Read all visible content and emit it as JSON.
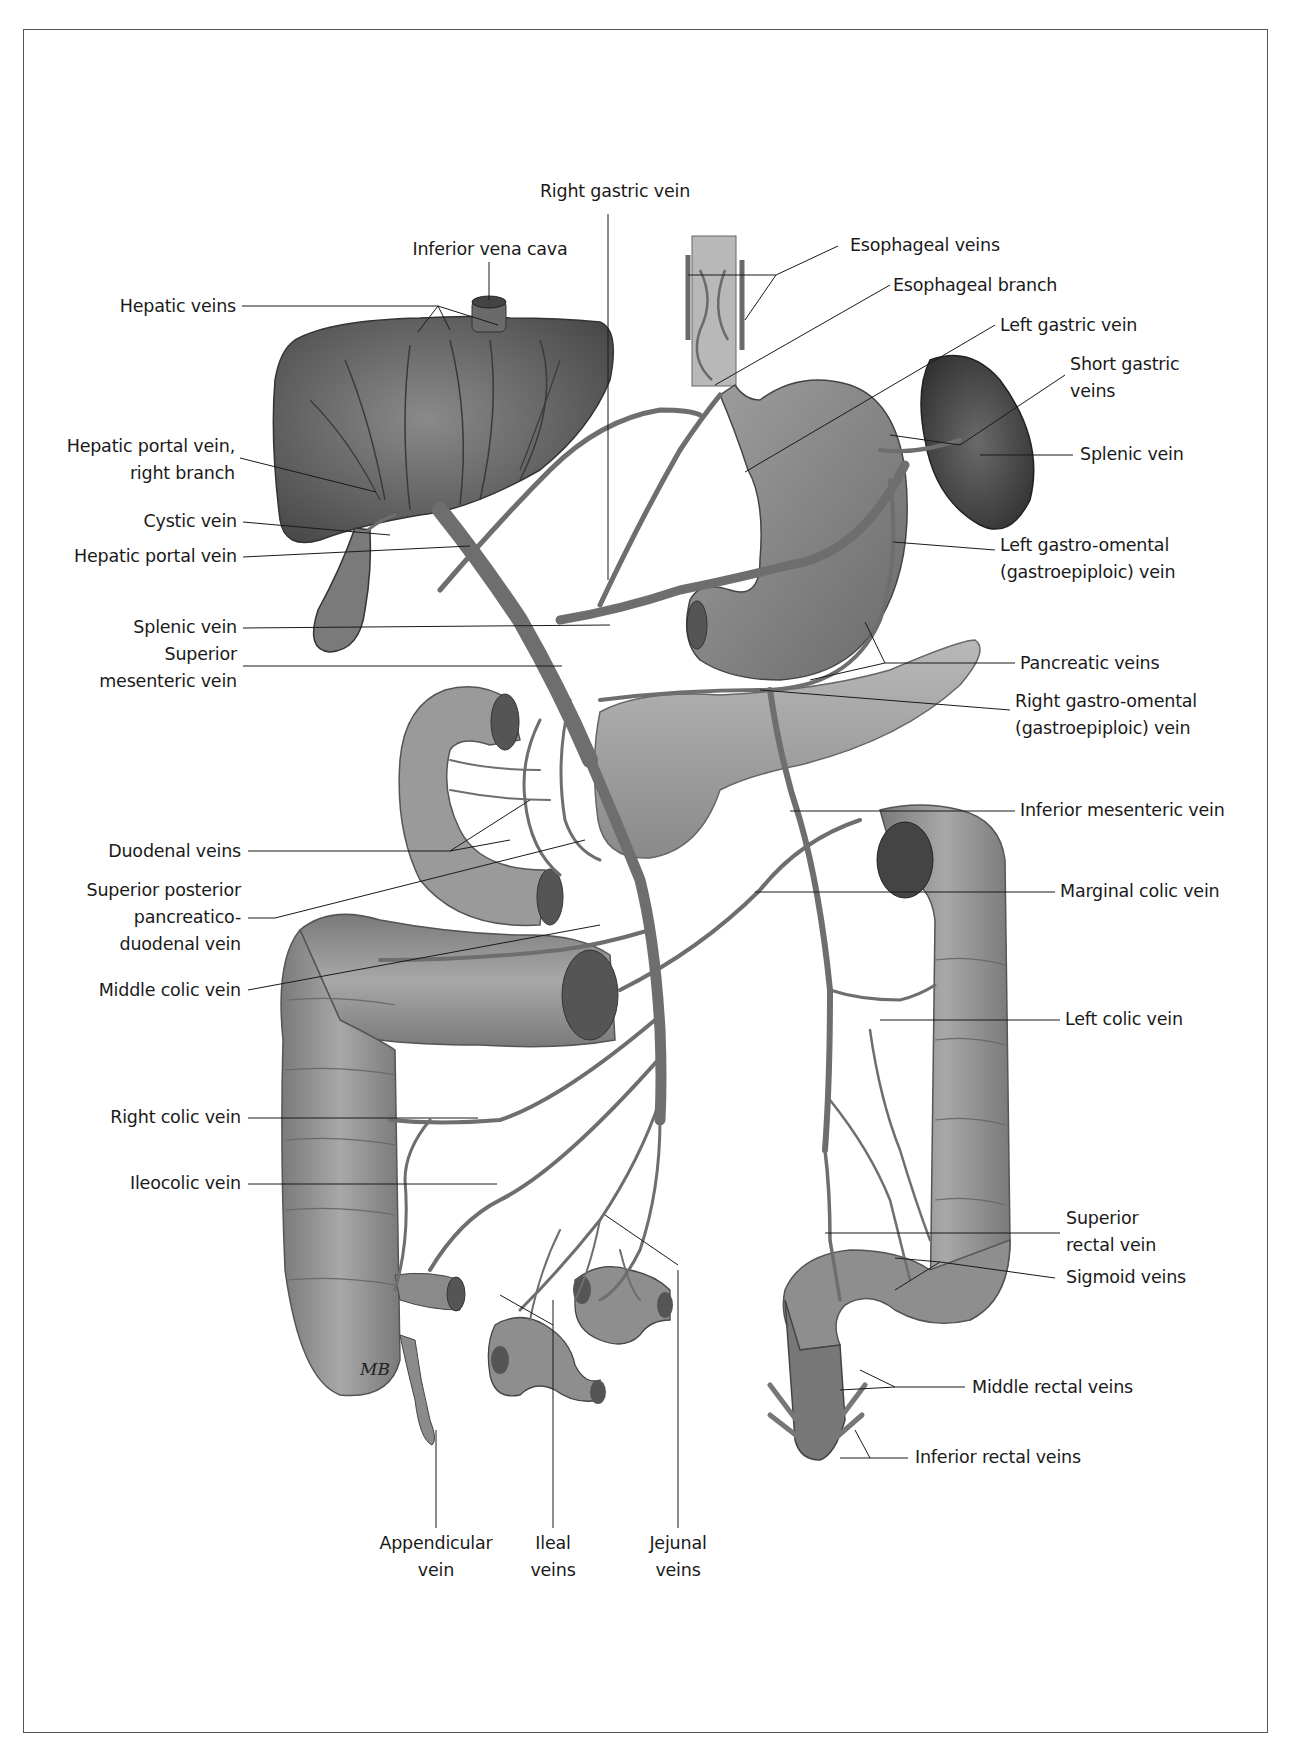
{
  "figure": {
    "signature": "MB",
    "colors": {
      "ink": "#1a1a1a",
      "frame": "#555555",
      "organ_dark": "#5a5a5a",
      "organ_mid": "#8c8c8c",
      "organ_light": "#b5b5b5",
      "vein": "#6e6e6e"
    }
  },
  "labels": {
    "right_gastric_vein": "Right gastric vein",
    "inferior_vena_cava": "Inferior vena cava",
    "hepatic_veins": "Hepatic veins",
    "esophageal_veins": "Esophageal veins",
    "esophageal_branch": "Esophageal branch",
    "left_gastric_vein": "Left gastric vein",
    "short_gastric_veins_1": "Short gastric",
    "short_gastric_veins_2": "veins",
    "splenic_vein_right": "Splenic vein",
    "hepatic_portal_right_branch_1": "Hepatic portal vein,",
    "hepatic_portal_right_branch_2": "right branch",
    "cystic_vein": "Cystic vein",
    "hepatic_portal_vein": "Hepatic portal vein",
    "left_gastro_omental_1": "Left gastro-omental",
    "left_gastro_omental_2": "(gastroepiploic) vein",
    "splenic_vein_left": "Splenic vein",
    "superior_mesenteric_1": "Superior",
    "superior_mesenteric_2": "mesenteric vein",
    "pancreatic_veins": "Pancreatic veins",
    "right_gastro_omental_1": "Right gastro-omental",
    "right_gastro_omental_2": "(gastroepiploic) vein",
    "inferior_mesenteric_vein": "Inferior mesenteric vein",
    "duodenal_veins": "Duodenal veins",
    "superior_posterior_1": "Superior posterior",
    "superior_posterior_2": "pancreatico-",
    "superior_posterior_3": "duodenal vein",
    "marginal_colic_vein": "Marginal colic vein",
    "middle_colic_vein": "Middle colic vein",
    "left_colic_vein": "Left colic vein",
    "right_colic_vein": "Right colic vein",
    "ileocolic_vein": "Ileocolic vein",
    "superior_rectal_1": "Superior",
    "superior_rectal_2": "rectal vein",
    "sigmoid_veins": "Sigmoid veins",
    "middle_rectal_veins": "Middle rectal veins",
    "inferior_rectal_veins": "Inferior rectal veins",
    "appendicular_1": "Appendicular",
    "appendicular_2": "vein",
    "ileal_1": "Ileal",
    "ileal_2": "veins",
    "jejunal_1": "Jejunal",
    "jejunal_2": "veins"
  }
}
